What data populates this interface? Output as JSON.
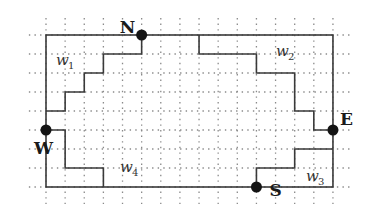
{
  "diagram": {
    "grid": {
      "origin_x": 46,
      "origin_y": 35,
      "step_x": 19.13,
      "step_y": 19,
      "cols": 15,
      "rows": 8,
      "extend": 1,
      "dot_color": "#8a8a8a",
      "line_color": "#3a3a3a"
    },
    "boundary": {
      "from": [
        0,
        0
      ],
      "to": [
        15,
        8
      ]
    },
    "points": [
      {
        "id": "N",
        "label": "N",
        "at": [
          5,
          0
        ],
        "label_dx": -22,
        "label_dy": -2
      },
      {
        "id": "W",
        "label": "W",
        "at": [
          0,
          5
        ],
        "label_dx": -12,
        "label_dy": 24
      },
      {
        "id": "E",
        "label": "E",
        "at": [
          15,
          5
        ],
        "label_dx": 7,
        "label_dy": -5
      },
      {
        "id": "S",
        "label": "S",
        "at": [
          11,
          8
        ],
        "label_dx": 13,
        "label_dy": 9
      }
    ],
    "paths": [
      {
        "id": "w1-path",
        "pts": [
          [
            5,
            0
          ],
          [
            5,
            1
          ],
          [
            3,
            1
          ],
          [
            3,
            2
          ],
          [
            2,
            2
          ],
          [
            2,
            3
          ],
          [
            1,
            3
          ],
          [
            1,
            4
          ],
          [
            0,
            4
          ]
        ]
      },
      {
        "id": "w4-path",
        "pts": [
          [
            0,
            5
          ],
          [
            1,
            5
          ],
          [
            1,
            7
          ],
          [
            3,
            7
          ],
          [
            3,
            8
          ]
        ]
      },
      {
        "id": "w2-path",
        "pts": [
          [
            8,
            0
          ],
          [
            8,
            1
          ],
          [
            11,
            1
          ],
          [
            11,
            2
          ],
          [
            13,
            2
          ],
          [
            13,
            4
          ],
          [
            14,
            4
          ],
          [
            14,
            5
          ],
          [
            15,
            5
          ]
        ]
      },
      {
        "id": "w3-path",
        "pts": [
          [
            15,
            6
          ],
          [
            13,
            6
          ],
          [
            13,
            7
          ],
          [
            11,
            7
          ],
          [
            11,
            8
          ]
        ]
      }
    ],
    "regions": [
      {
        "id": "w1",
        "letter": "w",
        "sub": "1",
        "x": 56,
        "y": 65
      },
      {
        "id": "w2",
        "letter": "w",
        "sub": "2",
        "x": 276,
        "y": 56
      },
      {
        "id": "w3",
        "letter": "w",
        "sub": "3",
        "x": 306,
        "y": 181
      },
      {
        "id": "w4",
        "letter": "w",
        "sub": "4",
        "x": 120,
        "y": 172
      }
    ]
  }
}
